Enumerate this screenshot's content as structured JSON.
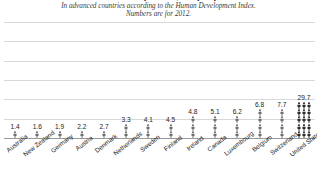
{
  "header": {
    "title": "Gun deaths per 100,000 people",
    "subtitle_line1": "In advanced countries according to the Human Development Index.",
    "subtitle_line2": "Numbers are for 2012."
  },
  "colors": {
    "icon": "#6e6e6e",
    "icon_dark": "#2b2b2b",
    "gridline": "#d8d8d8",
    "baseline": "#9a9a9a",
    "text": "#1b1b1b"
  },
  "chart_data": {
    "type": "bar",
    "title": "Gun deaths per 100,000 people",
    "subtitle": "In advanced countries according to the Human Development Index. Numbers are for 2012.",
    "xlabel": "",
    "ylabel": "",
    "ylim": [
      0,
      30
    ],
    "grid": true,
    "legend": null,
    "gridline_values": [
      5,
      10,
      15,
      20,
      25,
      30
    ],
    "pictogram_unit": "person icon",
    "categories": [
      "Australia",
      "New Zealand",
      "Germany",
      "Austria",
      "Denmark",
      "Netherlands",
      "Sweden",
      "Finland",
      "Ireland",
      "Canada",
      "Luxembourg",
      "Belgium",
      "Switzerland",
      "United States"
    ],
    "values": [
      1.4,
      1.6,
      1.9,
      2.2,
      2.7,
      3.3,
      4.1,
      4.5,
      4.8,
      5.1,
      6.2,
      6.8,
      7.7,
      29.7
    ],
    "value_labels": [
      "1.4",
      "1.6",
      "1.9",
      "2.2",
      "2.7",
      "3.3",
      "4.1",
      "4.5",
      "4.8",
      "5.1",
      "6.2",
      "6.8",
      "7.7",
      "29.7"
    ]
  }
}
